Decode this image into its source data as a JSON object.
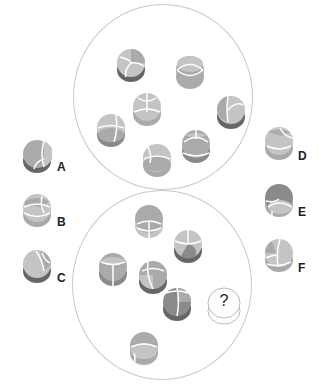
{
  "puzzle": {
    "question_mark": "?",
    "options": [
      {
        "label": "A",
        "x": 22,
        "y": 142,
        "lx": 58,
        "ly": 160
      },
      {
        "label": "B",
        "x": 22,
        "y": 196,
        "lx": 58,
        "ly": 214
      },
      {
        "label": "C",
        "x": 22,
        "y": 252,
        "lx": 58,
        "ly": 270
      },
      {
        "label": "D",
        "x": 265,
        "y": 130,
        "lx": 299,
        "ly": 150
      },
      {
        "label": "E",
        "x": 265,
        "y": 185,
        "lx": 299,
        "ly": 205
      },
      {
        "label": "F",
        "x": 265,
        "y": 241,
        "lx": 299,
        "ly": 261
      }
    ],
    "colors": {
      "light": "#c4c4c4",
      "mid": "#aaaaaa",
      "dark": "#8a8a8a",
      "darkest": "#666666",
      "circle_border": "#c8c8c8"
    }
  }
}
